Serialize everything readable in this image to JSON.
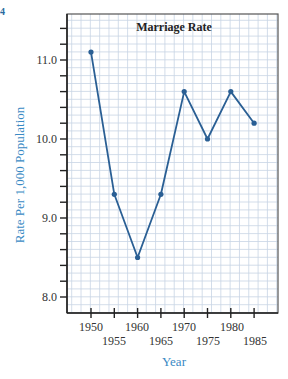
{
  "page_fragment": "4",
  "chart_data": {
    "type": "line",
    "title": "Marriage Rate",
    "xlabel": "Year",
    "ylabel": "Rate Per 1,000 Population",
    "x": [
      1950,
      1955,
      1960,
      1965,
      1970,
      1975,
      1980,
      1985
    ],
    "values": [
      11.1,
      9.3,
      8.5,
      9.3,
      10.6,
      10.0,
      10.6,
      10.2
    ],
    "ylim": [
      7.8,
      11.6
    ],
    "xlim": [
      1946,
      1991
    ],
    "yticks": [
      "11.0",
      "10.0",
      "9.0",
      "8.0"
    ],
    "xticks_upper": [
      "1950",
      "1960",
      "1970",
      "1980"
    ],
    "xticks_lower": [
      "1955",
      "1965",
      "1975",
      "1985"
    ],
    "grid": true,
    "line_color": "#2a5f94",
    "grid_color": "#c8d4e4"
  }
}
